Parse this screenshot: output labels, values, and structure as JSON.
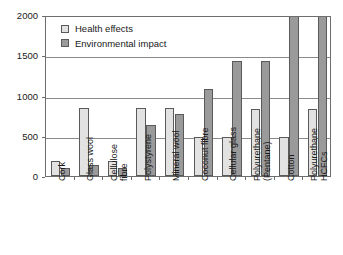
{
  "chart_data": {
    "type": "bar",
    "title": "",
    "subtitle": "",
    "xlabel": "",
    "ylabel": "",
    "ylim": [
      0,
      2000
    ],
    "yticks": [
      0,
      500,
      1000,
      1500,
      2000
    ],
    "ytick_labels": [
      "0",
      "500",
      "1000",
      "1500",
      "2000"
    ],
    "grid": true,
    "legend_position": "top-left-inside",
    "categories": [
      "Cork",
      "Glass wool",
      "Cellulose fibre",
      "Polystyrene",
      "Mineral wool",
      "Coconut fibre",
      "Cellular glass",
      "Polyurethane (Pentane)",
      "Cotton",
      "Polyurethane HCFCs"
    ],
    "category_lines": [
      [
        "Cork"
      ],
      [
        "Glass wool"
      ],
      [
        "Cellulose",
        "fibre"
      ],
      [
        "Polystyrene"
      ],
      [
        "Mineral wool"
      ],
      [
        "Coconut fibre"
      ],
      [
        "Cellular glass"
      ],
      [
        "Polyurethane",
        "(Pentane)"
      ],
      [
        "Cotton"
      ],
      [
        "Polyurethane",
        "HCFCs"
      ]
    ],
    "series": [
      {
        "name": "Health effects",
        "color": "#e2e2e2",
        "values": [
          190,
          845,
          190,
          845,
          840,
          490,
          490,
          830,
          490,
          830
        ],
        "clipped": [
          false,
          false,
          false,
          false,
          false,
          false,
          false,
          false,
          false,
          false
        ]
      },
      {
        "name": "Environmental impact",
        "color": "#9a9a9a",
        "values": [
          95,
          140,
          95,
          635,
          775,
          1075,
          1430,
          1425,
          2000,
          2000
        ],
        "clipped": [
          false,
          false,
          false,
          false,
          false,
          false,
          false,
          false,
          true,
          true
        ]
      }
    ],
    "annotations": []
  },
  "legend": {
    "items": [
      {
        "label": "Health effects",
        "swatch": "health"
      },
      {
        "label": "Environmental impact",
        "swatch": "env"
      }
    ]
  },
  "colors": {
    "health": "#e2e2e2",
    "environmental": "#9a9a9a",
    "axis": "#6e6e6e",
    "grid": "#8a8a8a",
    "text": "#1a1a1a",
    "background": "#ffffff"
  }
}
